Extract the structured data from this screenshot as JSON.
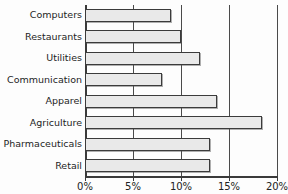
{
  "chart_data": {
    "type": "bar",
    "orientation": "horizontal",
    "title": "",
    "xlabel": "",
    "ylabel": "",
    "categories": [
      "Computers",
      "Restaurants",
      "Utilities",
      "Communication",
      "Apparel",
      "Agriculture",
      "Pharmaceuticals",
      "Retail"
    ],
    "values": [
      9.0,
      10.0,
      12.0,
      8.0,
      13.8,
      18.4,
      13.0,
      13.0
    ],
    "xlim": [
      0,
      20
    ],
    "xticks": [
      0,
      5,
      10,
      15,
      20
    ],
    "xtick_labels": [
      "0%",
      "5%",
      "10%",
      "15%",
      "20%"
    ],
    "grid": true,
    "gridlines_at": [
      5,
      10,
      15,
      20
    ],
    "legend": null,
    "bar_fill": "#e9e9e9",
    "bar_stroke": "#3b3b3b",
    "axis_color": "#3a3a3a"
  },
  "figure": {
    "title_clipped": "",
    "background": "#fdfdfd"
  }
}
